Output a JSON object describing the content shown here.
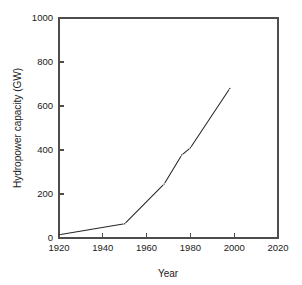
{
  "chart_data": {
    "type": "line",
    "title": "",
    "xlabel": "Year",
    "ylabel": "Hydropower capacity (GW)",
    "xlim": [
      1920,
      2020
    ],
    "ylim": [
      0,
      1000
    ],
    "xticks": [
      1920,
      1940,
      1960,
      1980,
      2000,
      2020
    ],
    "yticks": [
      0,
      200,
      400,
      600,
      800,
      1000
    ],
    "xtick_labels": [
      "1920",
      "1940",
      "1960",
      "1980",
      "2000",
      "2020"
    ],
    "ytick_labels": [
      "0",
      "200",
      "400",
      "600",
      "800",
      "1000"
    ],
    "grid": false,
    "legend": false,
    "series": [
      {
        "name": "Hydropower capacity",
        "color": "#262626",
        "linestyle": "solid-segmented",
        "x": [
          1920,
          1950,
          1968,
          1976,
          1980,
          1998
        ],
        "y": [
          15,
          65,
          245,
          377,
          410,
          680
        ]
      }
    ],
    "annotations": []
  },
  "figure": {
    "background": "#ffffff",
    "axis_color": "#4d4d4d",
    "text_color": "#1a1a1a",
    "plot_left": 59,
    "plot_right": 278,
    "plot_top": 18,
    "plot_bottom": 238
  }
}
